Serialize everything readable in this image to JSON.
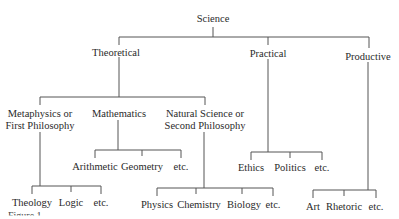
{
  "diagram": {
    "root": "Science",
    "branches": [
      {
        "label": "Theoretical",
        "children": [
          {
            "label_line1": "Metaphysics or",
            "label_line2": "First Philosophy",
            "children": [
              "Theology",
              "Logic",
              "etc."
            ]
          },
          {
            "label_line1": "Mathematics",
            "children": [
              "Arithmetic",
              "Geometry",
              "etc."
            ]
          },
          {
            "label_line1": "Natural Science or",
            "label_line2": "Second Philosophy",
            "children": [
              "Physics",
              "Chemistry",
              "Biology",
              "etc."
            ]
          }
        ]
      },
      {
        "label": "Practical",
        "children": [
          "Ethics",
          "Politics",
          "etc."
        ]
      },
      {
        "label": "Productive",
        "children": [
          "Art",
          "Rhetoric",
          "etc."
        ]
      }
    ],
    "caption": "Figure 1."
  }
}
